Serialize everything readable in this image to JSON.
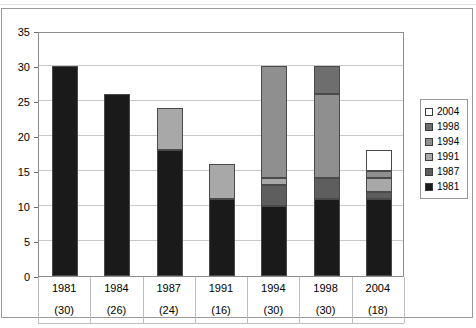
{
  "chart_data": {
    "type": "bar",
    "stacked": true,
    "title": "",
    "xlabel": "",
    "ylabel": "",
    "ylim": [
      0,
      35
    ],
    "ytick_step": 5,
    "yticks": [
      0,
      5,
      10,
      15,
      20,
      25,
      30,
      35
    ],
    "grid": true,
    "legend_position": "right",
    "categories": [
      "1981",
      "1984",
      "1987",
      "1991",
      "1994",
      "1998",
      "2004"
    ],
    "category_sublabels": [
      "(30)",
      "(26)",
      "(24)",
      "(16)",
      "(30)",
      "(30)",
      "(18)"
    ],
    "series": [
      {
        "name": "1981",
        "color": "#1a1a1a",
        "values": [
          30,
          26,
          18,
          11,
          10,
          11,
          11
        ]
      },
      {
        "name": "1987",
        "color": "#5e5e5e",
        "values": [
          0,
          0,
          0,
          0,
          3,
          3,
          1
        ]
      },
      {
        "name": "1991",
        "color": "#a8a8a8",
        "values": [
          0,
          0,
          6,
          5,
          1,
          0,
          2
        ]
      },
      {
        "name": "1994",
        "color": "#8f8f8f",
        "values": [
          0,
          0,
          0,
          0,
          16,
          12,
          1
        ]
      },
      {
        "name": "1998",
        "color": "#6e6e6e",
        "values": [
          0,
          0,
          0,
          0,
          0,
          4,
          0
        ]
      },
      {
        "name": "2004",
        "color": "#ffffff",
        "values": [
          0,
          0,
          0,
          0,
          0,
          0,
          3
        ]
      }
    ],
    "totals": [
      30,
      26,
      24,
      16,
      30,
      30,
      18
    ],
    "legend": [
      {
        "label": "2004",
        "color": "#ffffff"
      },
      {
        "label": "1998",
        "color": "#6e6e6e"
      },
      {
        "label": "1994",
        "color": "#8f8f8f"
      },
      {
        "label": "1991",
        "color": "#a8a8a8"
      },
      {
        "label": "1987",
        "color": "#5e5e5e"
      },
      {
        "label": "1981",
        "color": "#1a1a1a"
      }
    ]
  }
}
